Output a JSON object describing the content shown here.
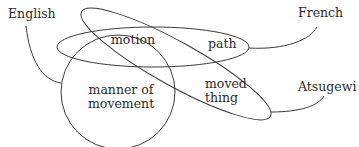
{
  "diagram": {
    "type": "venn-like concept diagram",
    "regions": {
      "motion": "motion",
      "path": "path",
      "moved_thing": [
        "moved",
        "thing"
      ],
      "manner_of_movement": [
        "manner of",
        "movement"
      ]
    },
    "languages": {
      "english": "English",
      "french": "French",
      "atsugewi": "Atsugewi"
    },
    "stroke_color": "#3a3a3a",
    "text_color": "#2b2b2b"
  }
}
